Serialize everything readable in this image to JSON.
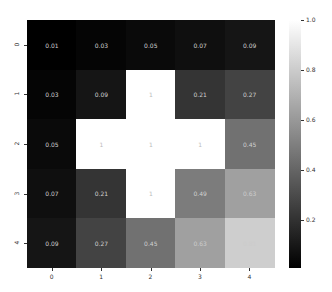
{
  "chart_data": {
    "type": "heatmap",
    "title": "",
    "xlabel": "",
    "ylabel": "",
    "x_tick_labels": [
      "0",
      "1",
      "2",
      "3",
      "4"
    ],
    "y_tick_labels": [
      "0",
      "1",
      "2",
      "3",
      "4"
    ],
    "values": [
      [
        0.01,
        0.03,
        0.05,
        0.07,
        0.09
      ],
      [
        0.03,
        0.09,
        1,
        0.21,
        0.27
      ],
      [
        0.05,
        1,
        1,
        1,
        0.45
      ],
      [
        0.07,
        0.21,
        1,
        0.49,
        0.63
      ],
      [
        0.09,
        0.27,
        0.45,
        0.63,
        0.81
      ]
    ],
    "annotations": [
      [
        "0.01",
        "0.03",
        "0.05",
        "0.07",
        "0.09"
      ],
      [
        "0.03",
        "0.09",
        "1",
        "0.21",
        "0.27"
      ],
      [
        "0.05",
        "1",
        "1",
        "1",
        "0.45"
      ],
      [
        "0.07",
        "0.21",
        "1",
        "0.49",
        "0.63"
      ],
      [
        "0.09",
        "0.27",
        "0.45",
        "0.63",
        "0.81"
      ]
    ],
    "colormap": "gray",
    "colorbar": {
      "min": 0.01,
      "max": 1.0,
      "ticks": [
        "0.2",
        "0.4",
        "0.6",
        "0.8",
        "1.0"
      ],
      "tick_values": [
        0.2,
        0.4,
        0.6,
        0.8,
        1.0
      ]
    },
    "grid": false,
    "legend_position": "right colorbar"
  }
}
